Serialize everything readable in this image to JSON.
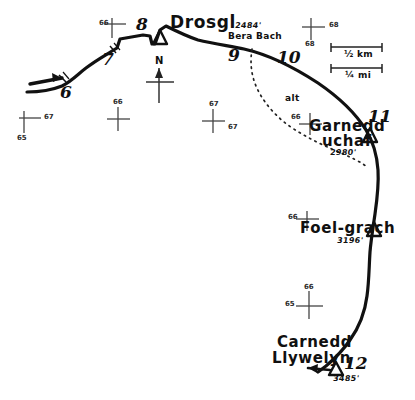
{
  "map": {
    "title": "Drosgl to Carnedd Llywelyn walking route map",
    "ink_color": "#111111",
    "background_color": "#ffffff"
  },
  "summits": [
    {
      "name": "Drosgl",
      "height": "2484'",
      "marker": "triangle"
    },
    {
      "name": "Garnedd\nuchaf",
      "height": "2980'",
      "marker": "triangle"
    },
    {
      "name": "Foel-grach",
      "height": "3196'",
      "marker": "triangle"
    },
    {
      "name": "Carnedd\nLlywelyn",
      "height": "3485'",
      "marker": "triangle"
    }
  ],
  "labels": {
    "drosgl": "Drosgl",
    "drosgl_height": "2484'",
    "bera_bach": "Bera Bach",
    "garnedd_uchaf_line1": "Garnedd",
    "garnedd_uchaf_line2": "uchaf",
    "garnedd_uchaf_height": "2980'",
    "foel_grach": "Foel-grach",
    "foel_grach_height": "3196'",
    "carnedd_line1": "Carnedd",
    "carnedd_line2": "Llywelyn",
    "carnedd_height": "3485'",
    "alt_path": "alt"
  },
  "waypoints": [
    {
      "id": "6",
      "label": "6"
    },
    {
      "id": "7",
      "label": "7"
    },
    {
      "id": "8",
      "label": "8"
    },
    {
      "id": "9",
      "label": "9"
    },
    {
      "id": "10",
      "label": "10"
    },
    {
      "id": "11",
      "label": "11"
    },
    {
      "id": "12",
      "label": "12"
    }
  ],
  "compass": {
    "north_label": "N"
  },
  "scale": {
    "km_label": "½ km",
    "mi_label": "¼ mi"
  },
  "grid_labels": {
    "top_left_66": "66",
    "top_right_68_h": "68",
    "top_right_68_v": "68",
    "left_67": "67",
    "left_65": "65",
    "mid_66": "66",
    "centre_67_v": "67",
    "centre_67_h": "67",
    "garnedd_66": "66",
    "foel_66": "66",
    "lower_66": "66",
    "lower_65": "65"
  }
}
